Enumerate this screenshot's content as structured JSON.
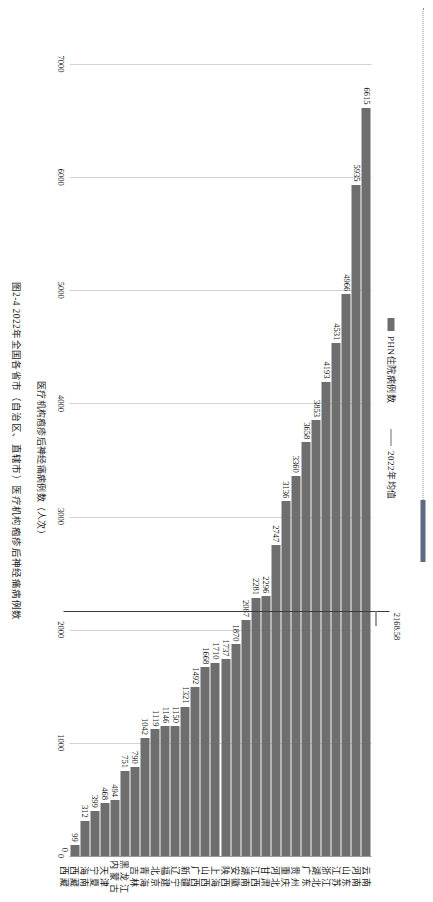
{
  "figure": {
    "caption": "图2-4  2022年全国各省市（自治区、直辖市）医疗机构疱疹后神经痛病例数",
    "rule_cap_color": "#5b6b82",
    "bar_color": "#6e6e6e",
    "mean_line_color": "#3b3b3b"
  },
  "legend": {
    "series_label": "PHN住院病例数",
    "mean_label": "2022年均值"
  },
  "axis": {
    "value_title": "医疗机构疱疹后神经痛病例数（人次）",
    "ticks": [
      "7000",
      "6000",
      "5000",
      "4000",
      "3000",
      "2000",
      "1000",
      "0"
    ],
    "max": 7000,
    "min": 0
  },
  "mean": {
    "value": 2168.58,
    "label": "2168.58"
  },
  "chart_data": {
    "type": "bar",
    "title": "图2-4  2022年全国各省市（自治区、直辖市）医疗机构疱疹后神经痛病例数",
    "xlabel": "医疗机构疱疹后神经痛病例数（人次）",
    "ylabel": "",
    "orientation": "horizontal",
    "grid": true,
    "legend_position": "top",
    "xlim": [
      0,
      7000
    ],
    "xticks": [
      0,
      1000,
      2000,
      3000,
      4000,
      5000,
      6000,
      7000
    ],
    "mean_line": 2168.58,
    "categories": [
      "云南",
      "河南",
      "山东",
      "江苏",
      "浙江",
      "湖北",
      "广东",
      "贵州",
      "重庆",
      "河北",
      "甘肃",
      "江西",
      "湖南",
      "安徽",
      "陕西",
      "上海",
      "山西",
      "广西",
      "新疆",
      "辽宁",
      "福建",
      "北京",
      "青海",
      "吉林",
      "黑龙江",
      "内蒙古",
      "天津",
      "宁夏",
      "海南",
      "西藏"
    ],
    "values": [
      6615,
      5935,
      4966,
      4531,
      4193,
      3853,
      3658,
      3360,
      3136,
      2747,
      2296,
      2281,
      2087,
      1870,
      1737,
      1710,
      1668,
      1492,
      1321,
      1150,
      1146,
      1119,
      1042,
      790,
      751,
      494,
      468,
      399,
      312,
      99
    ],
    "series": [
      {
        "name": "PHN住院病例数",
        "values": [
          6615,
          5935,
          4966,
          4531,
          4193,
          3853,
          3658,
          3360,
          3136,
          2747,
          2296,
          2281,
          2087,
          1870,
          1737,
          1710,
          1668,
          1492,
          1321,
          1150,
          1146,
          1119,
          1042,
          790,
          751,
          494,
          468,
          399,
          312,
          99
        ]
      },
      {
        "name": "2022年均值",
        "type": "line",
        "value": 2168.58
      }
    ],
    "extra_category": {
      "label": "西藏",
      "value": 0,
      "value_label": "0"
    }
  }
}
